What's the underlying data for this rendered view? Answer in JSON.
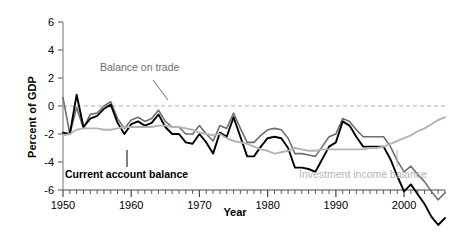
{
  "chart_data": {
    "type": "line",
    "title": "",
    "xlabel": "Year",
    "ylabel": "Percent of GDP",
    "xlim": [
      1950,
      2006
    ],
    "ylim": [
      -6,
      6
    ],
    "grid": false,
    "zero_line": true,
    "legend_position": "inline-annotations",
    "yticks": [
      6,
      4,
      2,
      0,
      -2,
      -4,
      -6
    ],
    "ytick_labels": [
      "6",
      "4",
      "2",
      "0",
      "-2",
      "-4",
      "-6"
    ],
    "xticks": [
      1950,
      1960,
      1970,
      1980,
      1990,
      2000
    ],
    "xtick_labels": [
      "1950",
      "1960",
      "1970",
      "1980",
      "1990",
      "2000"
    ],
    "minor_xtick_interval": 1,
    "x": [
      1950,
      1951,
      1952,
      1953,
      1954,
      1955,
      1956,
      1957,
      1958,
      1959,
      1960,
      1961,
      1962,
      1963,
      1964,
      1965,
      1966,
      1967,
      1968,
      1969,
      1970,
      1971,
      1972,
      1973,
      1974,
      1975,
      1976,
      1977,
      1978,
      1979,
      1980,
      1981,
      1982,
      1983,
      1984,
      1985,
      1986,
      1987,
      1988,
      1989,
      1990,
      1991,
      1992,
      1993,
      1994,
      1995,
      1996,
      1997,
      1998,
      1999,
      2000,
      2001,
      2002,
      2003,
      2004,
      2005,
      2006
    ],
    "series": [
      {
        "name": "Balance on trade",
        "color": "#6e6e6e",
        "width": 1.6,
        "label_x": 100,
        "label_y": 61,
        "values": [
          0.6,
          -2.0,
          -0.1,
          -1.6,
          -0.6,
          -0.5,
          0.0,
          0.3,
          -0.9,
          -1.6,
          -1.0,
          -0.8,
          -1.1,
          -0.9,
          -0.3,
          -1.1,
          -1.5,
          -1.5,
          -2.0,
          -2.0,
          -1.4,
          -2.0,
          -2.5,
          -1.4,
          -1.6,
          -0.5,
          -1.6,
          -2.6,
          -2.6,
          -2.1,
          -1.7,
          -1.6,
          -1.7,
          -2.3,
          -3.4,
          -3.4,
          -3.5,
          -3.6,
          -2.9,
          -2.2,
          -2.0,
          -0.9,
          -1.1,
          -1.7,
          -2.2,
          -2.2,
          -2.2,
          -2.2,
          -2.9,
          -3.9,
          -4.7,
          -4.3,
          -4.9,
          -5.4,
          -6.1,
          -6.7,
          -6.2
        ]
      },
      {
        "name": "Current account balance",
        "color": "#000000",
        "width": 1.9,
        "label_x": 65,
        "label_y": 168,
        "values": [
          -1.9,
          -2.0,
          0.8,
          -1.5,
          -0.9,
          -0.7,
          -0.2,
          0.1,
          -1.2,
          -2.0,
          -1.3,
          -1.1,
          -1.4,
          -1.2,
          -0.6,
          -1.5,
          -2.0,
          -2.0,
          -2.6,
          -2.7,
          -2.0,
          -2.6,
          -3.4,
          -1.9,
          -2.2,
          -0.8,
          -2.2,
          -3.6,
          -3.6,
          -2.9,
          -2.3,
          -2.2,
          -2.3,
          -3.0,
          -4.4,
          -4.4,
          -4.5,
          -4.7,
          -3.8,
          -2.9,
          -2.6,
          -1.1,
          -1.4,
          -2.2,
          -2.9,
          -2.9,
          -2.9,
          -2.9,
          -3.8,
          -5.0,
          -6.1,
          -5.6,
          -6.3,
          -7.0,
          -7.9,
          -8.5,
          -8.0
        ]
      },
      {
        "name": "Investment income balance",
        "color": "#b4b4b4",
        "width": 1.9,
        "label_x": 299,
        "label_y": 168,
        "values": [
          -2.1,
          -2.0,
          -1.7,
          -1.6,
          -1.6,
          -1.6,
          -1.7,
          -1.7,
          -1.6,
          -1.5,
          -1.5,
          -1.5,
          -1.5,
          -1.5,
          -1.4,
          -1.4,
          -1.5,
          -1.5,
          -1.6,
          -1.7,
          -1.9,
          -2.0,
          -2.1,
          -2.0,
          -2.3,
          -2.5,
          -2.6,
          -2.7,
          -2.9,
          -3.1,
          -3.2,
          -3.4,
          -3.3,
          -3.2,
          -3.0,
          -3.1,
          -3.2,
          -3.2,
          -3.1,
          -3.1,
          -3.1,
          -3.1,
          -3.1,
          -3.1,
          -3.1,
          -3.0,
          -3.0,
          -2.9,
          -2.7,
          -2.5,
          -2.3,
          -2.1,
          -1.8,
          -1.6,
          -1.3,
          -1.0,
          -0.8
        ]
      }
    ]
  },
  "annotations": {
    "trade_label": "Balance on trade",
    "current_label": "Current account balance",
    "investment_label": "Investment income balance"
  },
  "axes": {
    "ylabel": "Percent of GDP",
    "xlabel": "Year"
  }
}
